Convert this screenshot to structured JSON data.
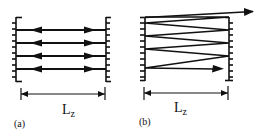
{
  "diagram": {
    "stroke_color": "#111111",
    "background": "#ffffff",
    "panels": [
      {
        "id": "a",
        "caption": "(a)",
        "dimension_label": "L",
        "dimension_subscript": "z",
        "description": "Four parallel rays bouncing back and forth between two walls (bidirectional arrows)",
        "ray_count": 4
      },
      {
        "id": "b",
        "caption": "(b)",
        "dimension_label": "L",
        "dimension_subscript": "z",
        "description": "Zigzag ray reflecting between two walls, exiting past the right wall at top",
        "reflections": 8
      }
    ]
  }
}
